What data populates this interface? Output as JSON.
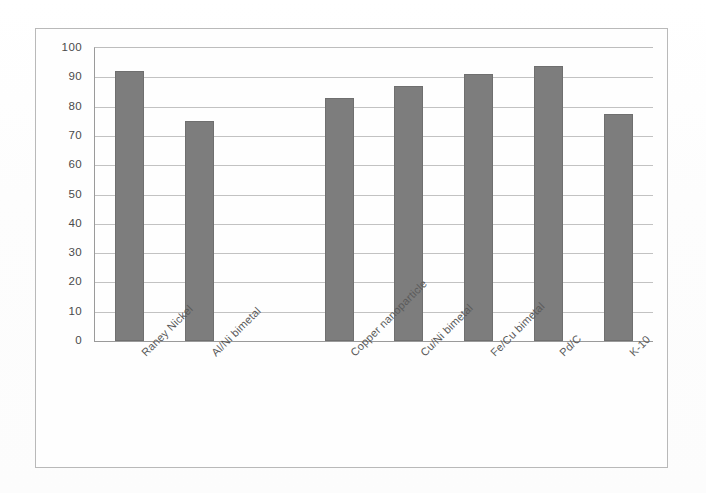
{
  "chart_data": {
    "type": "bar",
    "title": "",
    "subtitle": "",
    "xlabel": "",
    "ylabel": "",
    "categories": [
      "Raney Nickel",
      "Al/Ni bimetal",
      "",
      "Copper nanoparticle",
      "Cu/Ni bimetal",
      "Fe/Cu bimetal",
      "Pd/C",
      "K-10"
    ],
    "values": [
      92,
      75,
      null,
      83,
      87,
      91,
      94,
      77.5
    ],
    "ylim": [
      0,
      100
    ],
    "ytick_step": 10,
    "yticks": [
      100,
      90,
      80,
      70,
      60,
      50,
      40,
      30,
      20,
      10,
      0
    ],
    "ytick_labels": [
      "100",
      "90",
      "80",
      "70",
      "60",
      "50",
      "40",
      "30",
      "20",
      "10",
      "0"
    ],
    "grid": true,
    "grid_axis": "y",
    "legend": false,
    "legend_position": "none",
    "series": [
      {
        "name": "Conversion",
        "values": [
          92,
          75,
          null,
          83,
          87,
          91,
          94,
          77.5
        ]
      }
    ],
    "bar_color": "#7d7d7d",
    "gridline_color": "#c2c2c2",
    "axis_color": "#9a9a9a",
    "plot_background": "#fefefe",
    "xtick_label_rotation": -45
  }
}
